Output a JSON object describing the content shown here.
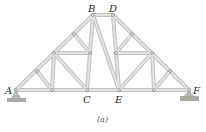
{
  "figure": {
    "caption": "(a)",
    "labels": {
      "A": "A",
      "B": "B",
      "C": "C",
      "D": "D",
      "E": "E",
      "F": "F"
    },
    "colors": {
      "member_fill": "#d9dcd7",
      "member_edge": "#b9bdb6",
      "pin": "#8d918a",
      "support": "#a7aba4"
    },
    "nodes": {
      "A": [
        16,
        90
      ],
      "B": [
        93,
        15
      ],
      "D": [
        113,
        15
      ],
      "C": [
        87,
        90
      ],
      "E": [
        119,
        90
      ],
      "F": [
        189,
        90
      ],
      "L1": [
        37,
        71
      ],
      "L2": [
        54,
        53
      ],
      "L3": [
        74,
        34
      ],
      "LB1": [
        52,
        90
      ],
      "LM": [
        90,
        53
      ],
      "R1": [
        132,
        34
      ],
      "R2": [
        152,
        53
      ],
      "R3": [
        170,
        71
      ],
      "RB1": [
        154,
        90
      ],
      "RM": [
        116,
        53
      ]
    }
  }
}
